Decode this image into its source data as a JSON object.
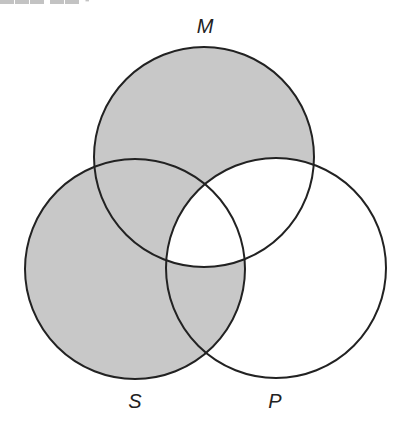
{
  "diagram": {
    "type": "venn-3-set",
    "shade_color": "#c8c8c8",
    "stroke_color": "#222222",
    "background": "#ffffff",
    "sets": [
      {
        "id": "M",
        "label": "M",
        "cx": 204,
        "cy": 157,
        "r": 110,
        "label_x": 205,
        "label_y": 26
      },
      {
        "id": "S",
        "label": "S",
        "cx": 135,
        "cy": 269,
        "r": 110,
        "label_x": 135,
        "label_y": 401
      },
      {
        "id": "P",
        "label": "P",
        "cx": 276,
        "cy": 268,
        "r": 110,
        "label_x": 275,
        "label_y": 401
      }
    ],
    "regions": [
      {
        "region": "M only",
        "shaded": true
      },
      {
        "region": "S only",
        "shaded": true
      },
      {
        "region": "P only",
        "shaded": false
      },
      {
        "region": "M and S, not P",
        "shaded": true
      },
      {
        "region": "S and P, not M",
        "shaded": true
      },
      {
        "region": "M and P, not S",
        "shaded": false
      },
      {
        "region": "M and S and P",
        "shaded": false
      }
    ]
  }
}
